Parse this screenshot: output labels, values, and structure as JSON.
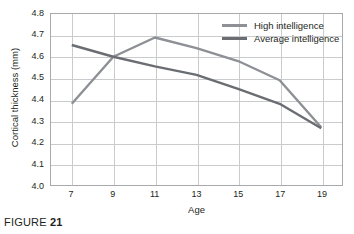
{
  "caption": {
    "word": "FIGURE",
    "number": "21"
  },
  "legend": {
    "position": "top-right",
    "items": [
      {
        "label": "High intelligence",
        "color": "#8d9095"
      },
      {
        "label": "Average intelligence",
        "color": "#6a6e72"
      }
    ]
  },
  "chart_data": {
    "type": "line",
    "title": "",
    "xlabel": "Age",
    "ylabel": "Cortical thickness (mm)",
    "x": [
      7,
      9,
      11,
      13,
      15,
      17,
      19
    ],
    "categories": [
      "7",
      "9",
      "11",
      "13",
      "15",
      "17",
      "19"
    ],
    "xlim": [
      6,
      20
    ],
    "ylim": [
      4.0,
      4.8
    ],
    "ytick_labels": [
      "4.8",
      "4.7",
      "4.6",
      "4.5",
      "4.4",
      "4.3",
      "4.2",
      "4.1",
      "4.0"
    ],
    "ytick_values": [
      4.8,
      4.7,
      4.6,
      4.5,
      4.4,
      4.3,
      4.2,
      4.1,
      4.0
    ],
    "xtick_labels": [
      "7",
      "9",
      "11",
      "13",
      "15",
      "17",
      "19"
    ],
    "grid": true,
    "legend_position": "top-right",
    "series": [
      {
        "name": "High intelligence",
        "color": "#8d9095",
        "values": [
          4.38,
          4.6,
          4.69,
          4.64,
          4.58,
          4.49,
          4.27
        ]
      },
      {
        "name": "Average intelligence",
        "color": "#6a6e72",
        "values": [
          4.655,
          4.6,
          4.555,
          4.515,
          4.45,
          4.38,
          4.265
        ]
      }
    ]
  }
}
